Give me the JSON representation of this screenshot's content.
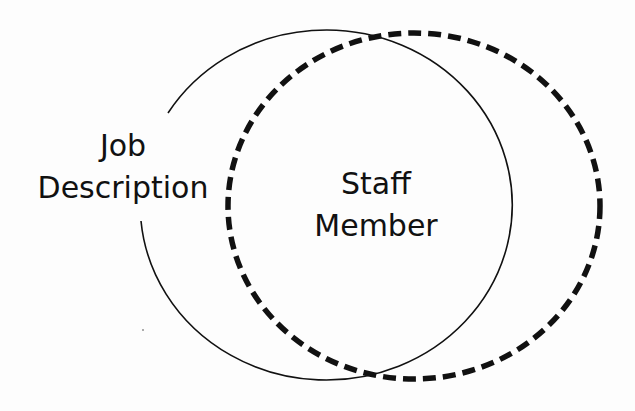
{
  "diagram": {
    "type": "overlapping-circles",
    "circles": [
      {
        "id": "job-description",
        "label_lines": [
          "Job",
          "Description"
        ],
        "style": "solid",
        "stroke_color": "#111111",
        "gap": "left side broken around label"
      },
      {
        "id": "staff-member",
        "label_lines": [
          "Staff",
          "Member"
        ],
        "style": "dashed",
        "stroke_color": "#111111"
      }
    ]
  },
  "labels": {
    "job": "Job",
    "description": "Description",
    "staff": "Staff",
    "member": "Member"
  }
}
